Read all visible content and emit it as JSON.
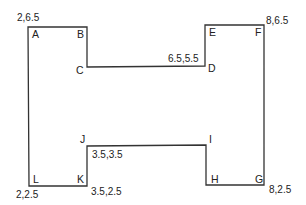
{
  "diagram": {
    "type": "polygon",
    "shape": "H-shape",
    "stroke_color": "#333333",
    "vertices": [
      {
        "name": "A",
        "x": 28,
        "y": 27,
        "label_x": 32,
        "label_y": 38
      },
      {
        "name": "B",
        "x": 87,
        "y": 27,
        "label_x": 77,
        "label_y": 38
      },
      {
        "name": "C",
        "x": 87,
        "y": 67,
        "label_x": 76,
        "label_y": 74
      },
      {
        "name": "D",
        "x": 205,
        "y": 66,
        "label_x": 208,
        "label_y": 72
      },
      {
        "name": "E",
        "x": 205,
        "y": 25,
        "label_x": 209,
        "label_y": 36
      },
      {
        "name": "F",
        "x": 264,
        "y": 25,
        "label_x": 255,
        "label_y": 36
      },
      {
        "name": "G",
        "x": 264,
        "y": 185,
        "label_x": 255,
        "label_y": 183
      },
      {
        "name": "H",
        "x": 206,
        "y": 185,
        "label_x": 211,
        "label_y": 183
      },
      {
        "name": "I",
        "x": 206,
        "y": 145,
        "label_x": 209,
        "label_y": 143
      },
      {
        "name": "J",
        "x": 87,
        "y": 146,
        "label_x": 80,
        "label_y": 143
      },
      {
        "name": "K",
        "x": 87,
        "y": 186,
        "label_x": 77,
        "label_y": 183
      },
      {
        "name": "L",
        "x": 29,
        "y": 186,
        "label_x": 33,
        "label_y": 183
      }
    ],
    "coordinate_labels": [
      {
        "text": "2,6.5",
        "vertex": "A",
        "x": 17,
        "y": 21
      },
      {
        "text": "6.5,5.5",
        "vertex": "D",
        "x": 168,
        "y": 62
      },
      {
        "text": "8,6.5",
        "vertex": "F",
        "x": 266,
        "y": 24
      },
      {
        "text": "3.5,3.5",
        "vertex": "J",
        "x": 92,
        "y": 158
      },
      {
        "text": "2,2.5",
        "vertex": "L",
        "x": 16,
        "y": 198
      },
      {
        "text": "3.5,2.5",
        "vertex": "K",
        "x": 91,
        "y": 195
      },
      {
        "text": "8,2.5",
        "vertex": "G",
        "x": 269,
        "y": 193
      }
    ]
  }
}
